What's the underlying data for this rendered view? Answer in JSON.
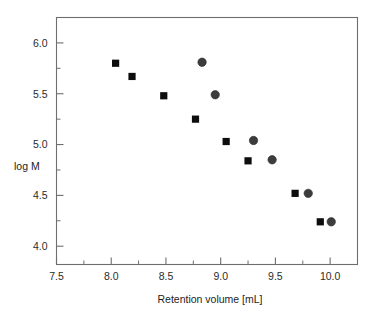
{
  "chart_data": {
    "type": "scatter",
    "title": "",
    "xlabel": "Retention volume [mL]",
    "ylabel": "log M",
    "xlim": [
      7.5,
      10.25
    ],
    "ylim": [
      3.82,
      6.25
    ],
    "grid": false,
    "legend": "none",
    "x_ticks": [
      "7.5",
      "8.0",
      "8.5",
      "9.0",
      "9.5",
      "10.0"
    ],
    "x_tick_values": [
      7.5,
      8.0,
      8.5,
      9.0,
      9.5,
      10.0
    ],
    "x_minor_tick_values": [
      7.75,
      8.25,
      8.75,
      9.25,
      9.75
    ],
    "y_ticks": [
      "4.0",
      "4.5",
      "5.0",
      "5.5",
      "6.0"
    ],
    "y_tick_values": [
      4.0,
      4.5,
      5.0,
      5.5,
      6.0
    ],
    "y_minor_tick_values": [
      4.25,
      4.75,
      5.25,
      5.75
    ],
    "series": [
      {
        "name": "series-squares",
        "marker": "square",
        "color": "#0d0d0d",
        "x": [
          8.04,
          8.19,
          8.48,
          8.77,
          9.05,
          9.25,
          9.68,
          9.91
        ],
        "y": [
          5.8,
          5.67,
          5.48,
          5.25,
          5.03,
          4.84,
          4.52,
          4.24
        ]
      },
      {
        "name": "series-circles",
        "marker": "circle",
        "color": "#3c3c3c",
        "x": [
          8.83,
          8.95,
          9.3,
          9.47,
          9.8,
          10.01
        ],
        "y": [
          5.81,
          5.49,
          5.04,
          4.85,
          4.52,
          4.24
        ]
      }
    ]
  },
  "labels": {
    "x_axis_title": "Retention volume [mL]",
    "y_axis_title": "log M",
    "x_tick_0": "7.5",
    "x_tick_1": "8.0",
    "x_tick_2": "8.5",
    "x_tick_3": "9.0",
    "x_tick_4": "9.5",
    "x_tick_5": "10.0",
    "y_tick_0": "4.0",
    "y_tick_1": "4.5",
    "y_tick_2": "5.0",
    "y_tick_3": "5.5",
    "y_tick_4": "6.0"
  },
  "colors": {
    "frame": "#6e6e6e",
    "square_marker": "#0d0d0d",
    "circle_marker": "#3c3c3c",
    "background": "#ffffff",
    "text": "#1d1d1d"
  }
}
